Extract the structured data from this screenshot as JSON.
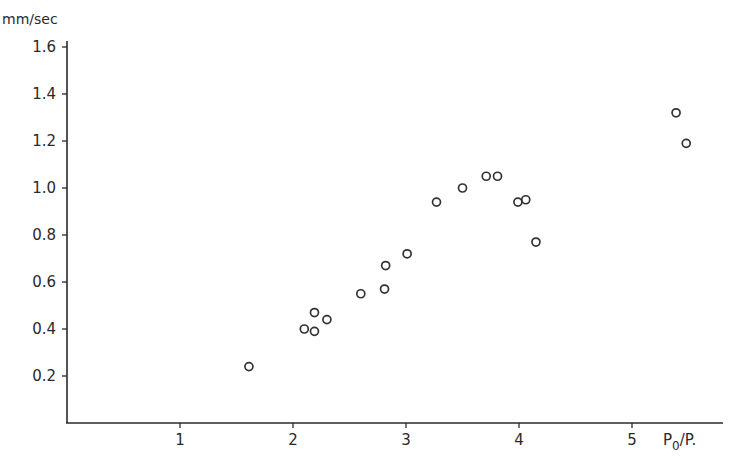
{
  "chart_data": {
    "type": "scatter",
    "title": "",
    "xlabel": "P0/P.",
    "xlabel_main": "P",
    "xlabel_sub": "0",
    "xlabel_tail": "/P.",
    "ylabel": "mm/sec",
    "xlim": [
      0,
      5.7
    ],
    "ylim": [
      0,
      1.65
    ],
    "grid": false,
    "legend": null,
    "x_ticks": [
      1,
      2,
      3,
      4,
      5
    ],
    "x_tick_labels": [
      "1",
      "2",
      "3",
      "4",
      "5"
    ],
    "y_ticks": [
      0.2,
      0.4,
      0.6,
      0.8,
      1.0,
      1.2,
      1.4,
      1.6
    ],
    "y_tick_labels": [
      "0.2",
      "0.4",
      "0.6",
      "0.8",
      "1.0",
      "1.2",
      "1.4",
      "1.6"
    ],
    "marker": "open-circle",
    "series": [
      {
        "name": "data",
        "points": [
          {
            "x": 1.61,
            "y": 0.24
          },
          {
            "x": 2.1,
            "y": 0.4
          },
          {
            "x": 2.19,
            "y": 0.47
          },
          {
            "x": 2.19,
            "y": 0.39
          },
          {
            "x": 2.3,
            "y": 0.44
          },
          {
            "x": 2.6,
            "y": 0.55
          },
          {
            "x": 2.81,
            "y": 0.57
          },
          {
            "x": 2.82,
            "y": 0.67
          },
          {
            "x": 3.01,
            "y": 0.72
          },
          {
            "x": 3.27,
            "y": 0.94
          },
          {
            "x": 3.5,
            "y": 1.0
          },
          {
            "x": 3.71,
            "y": 1.05
          },
          {
            "x": 3.81,
            "y": 1.05
          },
          {
            "x": 3.99,
            "y": 0.94
          },
          {
            "x": 4.06,
            "y": 0.95
          },
          {
            "x": 4.15,
            "y": 0.77
          },
          {
            "x": 5.39,
            "y": 1.32
          },
          {
            "x": 5.48,
            "y": 1.19
          }
        ]
      }
    ]
  },
  "colors": {
    "ink": "#2a2a2a",
    "background": "#ffffff"
  }
}
